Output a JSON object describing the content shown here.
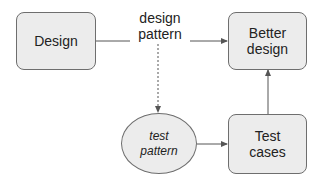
{
  "nodes": {
    "design": {
      "label": "Design"
    },
    "better_design": {
      "label": "Better\ndesign"
    },
    "test_pattern": {
      "label": "test\npattern"
    },
    "test_cases": {
      "label": "Test\ncases"
    }
  },
  "edges": {
    "design_to_better": {
      "label": "design\npattern"
    }
  },
  "colors": {
    "node_fill": "#ececec",
    "node_stroke": "#6e6e6e",
    "edge": "#555555"
  }
}
